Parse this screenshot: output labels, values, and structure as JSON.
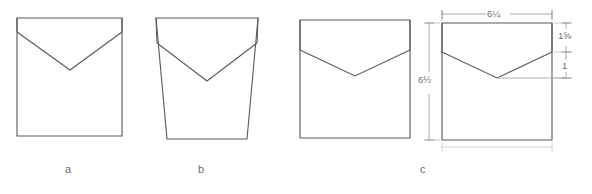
{
  "diagram": {
    "background_color": "#ffffff",
    "line_color": "#555a5e",
    "dimension_line_color": "#8d9296",
    "label_color": "#6a6f73"
  },
  "figures": [
    {
      "id": "figure-a",
      "caption": "a",
      "description": "Rectangular bag with shallow V-flap near top",
      "body_shape": "rectangle",
      "flap_depth": "shallow"
    },
    {
      "id": "figure-b",
      "caption": "b",
      "description": "Tapered trapezoidal bag with deep V-flap",
      "body_shape": "trapezoid",
      "flap_depth": "deep"
    },
    {
      "id": "figure-c",
      "caption": "c",
      "description": "Rectangular bag with V-flap, shown with and without dimensions",
      "body_shape": "rectangle",
      "flap_depth": "medium"
    }
  ],
  "dimensions": {
    "width": "6¼",
    "height": "6½",
    "flap_height": "1⅝",
    "flap_point_offset": "1"
  },
  "dimension_labels": [
    {
      "name": "width-dimension",
      "value": "6¼",
      "orientation": "horizontal",
      "position": "top"
    },
    {
      "name": "height-dimension",
      "value": "6½",
      "orientation": "vertical",
      "position": "left"
    },
    {
      "name": "flap-height-dimension",
      "value": "1⅝",
      "orientation": "vertical",
      "position": "right-upper"
    },
    {
      "name": "flap-point-dimension",
      "value": "1",
      "orientation": "vertical",
      "position": "right-lower"
    }
  ]
}
